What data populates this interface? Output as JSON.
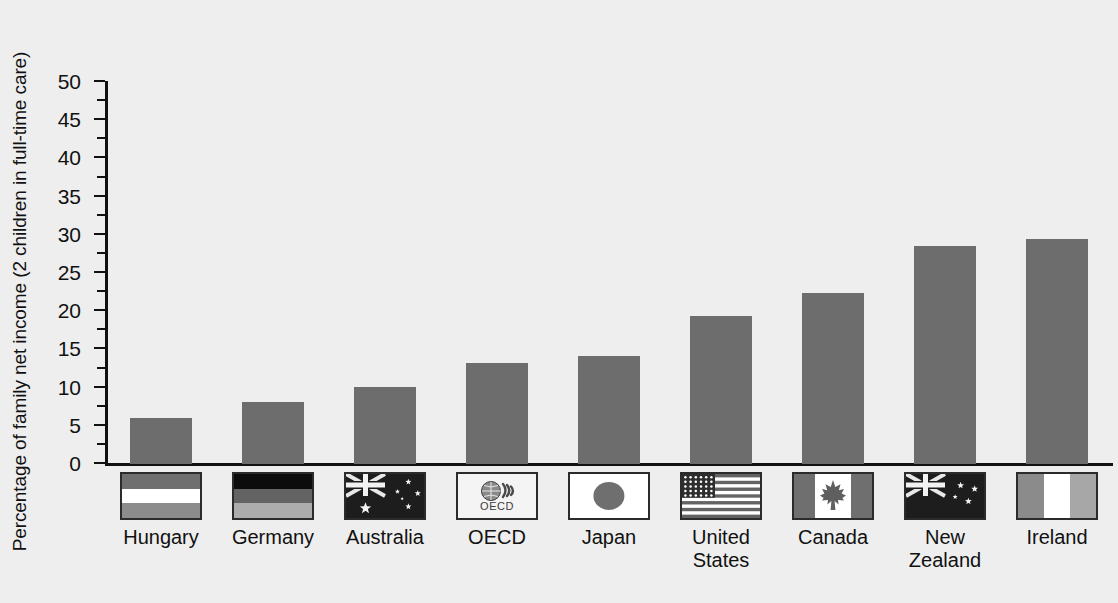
{
  "chart_data": {
    "type": "bar",
    "title": "",
    "subtitle": "",
    "xlabel": "",
    "ylabel": "Percentage of family net income (2 children in full-time care)",
    "ylim": [
      0,
      50
    ],
    "ytick_step": 5,
    "yticks": [
      "0",
      "5",
      "10",
      "15",
      "20",
      "25",
      "30",
      "35",
      "40",
      "45",
      "50"
    ],
    "grid": false,
    "legend": "none",
    "bar_color": "#6d6d6d",
    "categories": [
      "Hungary",
      "Germany",
      "Australia",
      "OECD",
      "Japan",
      "United States",
      "Canada",
      "New Zealand",
      "Ireland"
    ],
    "category_labels": [
      "Hungary",
      "Germany",
      "Australia",
      "OECD",
      "Japan",
      "United\nStates",
      "Canada",
      "New\nZealand",
      "Ireland"
    ],
    "category_icons": [
      "flag-hungary-icon",
      "flag-germany-icon",
      "flag-australia-icon",
      "oecd-logo-icon",
      "flag-japan-icon",
      "flag-united-states-icon",
      "flag-canada-icon",
      "flag-new-zealand-icon",
      "flag-ireland-icon"
    ],
    "values": [
      6.0,
      8.1,
      10.1,
      13.2,
      14.2,
      19.4,
      22.4,
      28.5,
      29.5
    ],
    "oecd_flag_text": "OECD"
  },
  "figure": {
    "background_color": "#eeeeee",
    "axis_color": "#111111"
  }
}
